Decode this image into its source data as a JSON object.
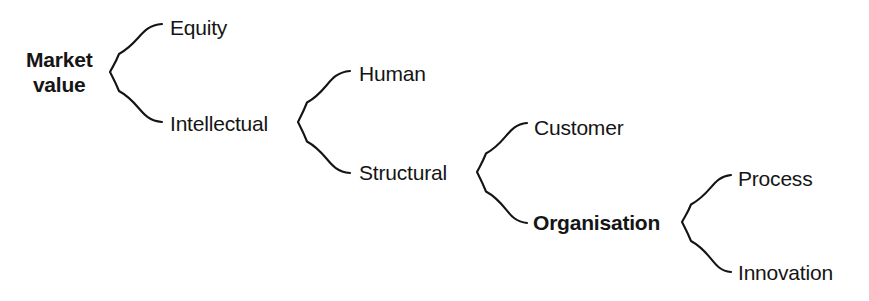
{
  "diagram": {
    "type": "hierarchy-brace-tree",
    "background_color": "#ffffff",
    "text_color": "#151515",
    "stroke_color": "#141414",
    "nodes": [
      {
        "id": "market-value",
        "label": "Market value",
        "label_line1": "Market",
        "label_line2": "value",
        "bold": true,
        "level": 0,
        "x": 26,
        "y": 72,
        "multiline": true
      },
      {
        "id": "equity",
        "label": "Equity",
        "bold": false,
        "level": 1,
        "x": 170,
        "y": 27,
        "multiline": false
      },
      {
        "id": "intellectual",
        "label": "Intellectual",
        "bold": false,
        "level": 1,
        "x": 170,
        "y": 123,
        "multiline": false
      },
      {
        "id": "human",
        "label": "Human",
        "bold": false,
        "level": 2,
        "x": 359,
        "y": 73,
        "multiline": false
      },
      {
        "id": "structural",
        "label": "Structural",
        "bold": false,
        "level": 2,
        "x": 359,
        "y": 172,
        "multiline": false
      },
      {
        "id": "customer",
        "label": "Customer",
        "bold": false,
        "level": 3,
        "x": 534,
        "y": 127,
        "multiline": false
      },
      {
        "id": "organisation",
        "label": "Organisation",
        "bold": true,
        "level": 3,
        "x": 533,
        "y": 222,
        "multiline": false
      },
      {
        "id": "process",
        "label": "Process",
        "bold": false,
        "level": 4,
        "x": 738,
        "y": 178,
        "multiline": false
      },
      {
        "id": "innovation",
        "label": "Innovation",
        "bold": false,
        "level": 4,
        "x": 738,
        "y": 272,
        "multiline": false
      }
    ],
    "braces": [
      {
        "id": "brace-market-value",
        "parent": "market-value",
        "children": [
          "equity",
          "intellectual"
        ],
        "tip_x": 110,
        "tip_y": 72,
        "top_y": 24,
        "bottom_y": 122,
        "arm_x": 162
      },
      {
        "id": "brace-intellectual",
        "parent": "intellectual",
        "children": [
          "human",
          "structural"
        ],
        "tip_x": 298,
        "tip_y": 122,
        "top_y": 71,
        "bottom_y": 173,
        "arm_x": 350
      },
      {
        "id": "brace-structural",
        "parent": "structural",
        "children": [
          "customer",
          "organisation"
        ],
        "tip_x": 477,
        "tip_y": 172,
        "top_y": 123,
        "bottom_y": 223,
        "arm_x": 527
      },
      {
        "id": "brace-organisation",
        "parent": "organisation",
        "children": [
          "process",
          "innovation"
        ],
        "tip_x": 682,
        "tip_y": 222,
        "top_y": 175,
        "bottom_y": 272,
        "arm_x": 731
      }
    ]
  }
}
